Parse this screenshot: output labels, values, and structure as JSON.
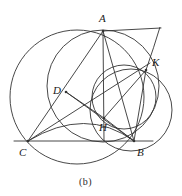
{
  "figure": {
    "caption": "(b)",
    "stroke_color": "#333333",
    "background": "#ffffff",
    "width": 182,
    "height": 196
  },
  "points": {
    "A": {
      "label": "A",
      "x": 103,
      "y": 31,
      "label_x": 99,
      "label_y": 13
    },
    "B": {
      "label": "B",
      "x": 134,
      "y": 141,
      "label_x": 137,
      "label_y": 147
    },
    "C": {
      "label": "C",
      "x": 28,
      "y": 141,
      "label_x": 19,
      "label_y": 147
    },
    "D": {
      "label": "D",
      "x": 66,
      "y": 92,
      "label_x": 53,
      "label_y": 85
    },
    "H": {
      "label": "H",
      "x": 104,
      "y": 118,
      "label_x": 99,
      "label_y": 122
    },
    "K": {
      "label": "K",
      "x": 146,
      "y": 70,
      "label_x": 152,
      "label_y": 57
    }
  },
  "segments": [
    {
      "name": "line-CB",
      "from": "C",
      "to": "B",
      "x1": 14,
      "y1": 141,
      "x2": 153,
      "y2": 141
    },
    {
      "name": "segment-AC",
      "from": "A",
      "to": "C",
      "x1": 103,
      "y1": 31,
      "x2": 28,
      "y2": 141
    },
    {
      "name": "segment-AB",
      "from": "A",
      "to": "B",
      "x1": 103,
      "y1": 31,
      "x2": 134,
      "y2": 141
    },
    {
      "name": "altitude-AH",
      "from": "A",
      "to": "H",
      "x1": 103,
      "y1": 31,
      "x2": 104,
      "y2": 141
    },
    {
      "name": "segment-AK",
      "from": "A",
      "to": "K",
      "x1": 103,
      "y1": 31,
      "x2": 161,
      "y2": 28
    },
    {
      "name": "segment-CD-H-K",
      "from": "C",
      "to": "K",
      "x1": 28,
      "y1": 141,
      "x2": 150,
      "y2": 63
    },
    {
      "name": "segment-DB",
      "from": "D",
      "to": "B",
      "x1": 66,
      "y1": 92,
      "x2": 134,
      "y2": 141
    },
    {
      "name": "segment-DH",
      "from": "D",
      "to": "H",
      "x1": 66,
      "y1": 92,
      "x2": 104,
      "y2": 118
    },
    {
      "name": "segment-HB",
      "from": "H",
      "to": "B",
      "x1": 104,
      "y1": 118,
      "x2": 134,
      "y2": 141
    },
    {
      "name": "segment-HK",
      "from": "H",
      "to": "K",
      "x1": 104,
      "y1": 118,
      "x2": 146,
      "y2": 70
    },
    {
      "name": "segment-BK",
      "from": "B",
      "to": "K",
      "x1": 134,
      "y1": 141,
      "x2": 146,
      "y2": 70
    }
  ],
  "circles": [
    {
      "name": "circumcircle-ABC",
      "cx": 77,
      "cy": 97,
      "r": 67
    },
    {
      "name": "circle-ADHB",
      "cx": 103,
      "cy": 86,
      "r": 56
    },
    {
      "name": "circle-HKB-right",
      "cx": 131,
      "cy": 110,
      "r": 41
    },
    {
      "name": "circle-through-H-K-B",
      "cx": 124,
      "cy": 97,
      "r": 32
    }
  ],
  "arcs": [
    {
      "name": "arc-C-to-B-through-H",
      "d": "M 28 141 Q 86 106 134 141"
    },
    {
      "name": "arc-K-upward",
      "d": "M 146 70 Q 154 47 160 27"
    }
  ]
}
